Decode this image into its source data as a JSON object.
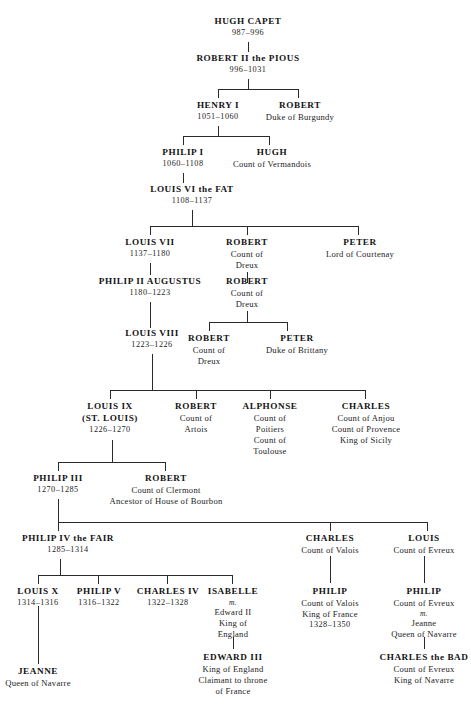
{
  "chart": {
    "kind": "genealogical-tree",
    "background_color": "#ffffff",
    "line_color": "#2a2a2a",
    "text_color": "#1a1a1a"
  },
  "people": {
    "hugh_capet": {
      "name": "HUGH CAPET",
      "dates": "987–996"
    },
    "robert_ii": {
      "name": "ROBERT II  the PIOUS",
      "dates": "996–1031"
    },
    "henry_i": {
      "name": "HENRY I",
      "dates": "1051–1060"
    },
    "robert_burgundy": {
      "name": "ROBERT",
      "t1": "Duke of Burgundy"
    },
    "philip_i": {
      "name": "PHILIP I",
      "dates": "1060–1108"
    },
    "hugh_vermandois": {
      "name": "HUGH",
      "t1": "Count of Vermandois"
    },
    "louis_vi": {
      "name": "LOUIS VI the FAT",
      "dates": "1108–1137"
    },
    "louis_vii": {
      "name": "LOUIS VII",
      "dates": "1137–1180"
    },
    "robert_dreux_1": {
      "name": "ROBERT",
      "t1": "Count of",
      "t2": "Dreux"
    },
    "peter_courtenay": {
      "name": "PETER",
      "t1": "Lord of Courtenay"
    },
    "philip_ii": {
      "name": "PHILIP II AUGUSTUS",
      "dates": "1180–1223"
    },
    "robert_dreux_2": {
      "name": "ROBERT",
      "t1": "Count of",
      "t2": "Dreux"
    },
    "louis_viii": {
      "name": "LOUIS VIII",
      "dates": "1223–1226"
    },
    "robert_dreux_3": {
      "name": "ROBERT",
      "t1": "Count of",
      "t2": "Dreux"
    },
    "peter_brittany": {
      "name": "PETER",
      "t1": "Duke of Brittany"
    },
    "louis_ix": {
      "name": "LOUIS IX",
      "name2": "(ST. LOUIS)",
      "dates": "1226–1270"
    },
    "robert_artois": {
      "name": "ROBERT",
      "t1": "Count of",
      "t2": "Artois"
    },
    "alphonse": {
      "name": "ALPHONSE",
      "t1": "Count of",
      "t2": "Poitiers",
      "t3": "Count of",
      "t4": "Toulouse"
    },
    "charles_anjou": {
      "name": "CHARLES",
      "t1": "Count of Anjou",
      "t2": "Count of Provence",
      "t3": "King of Sicily"
    },
    "philip_iii": {
      "name": "PHILIP III",
      "dates": "1270–1285"
    },
    "robert_clermont": {
      "name": "ROBERT",
      "t1": "Count of Clermont",
      "t2": "Ancestor of House of Bourbon"
    },
    "philip_iv": {
      "name": "PHILIP IV the FAIR",
      "dates": "1285–1314"
    },
    "charles_valois": {
      "name": "CHARLES",
      "t1": "Count of Valois"
    },
    "louis_evreux": {
      "name": "LOUIS",
      "t1": "Count of Evreux"
    },
    "louis_x": {
      "name": "LOUIS X",
      "dates": "1314–1316"
    },
    "philip_v": {
      "name": "PHILIP V",
      "dates": "1316–1322"
    },
    "charles_iv": {
      "name": "CHARLES IV",
      "dates": "1322–1328"
    },
    "isabelle": {
      "name": "ISABELLE",
      "marr": "m.",
      "t1": "Edward II",
      "t2": "King of",
      "t3": "England"
    },
    "philip_vi": {
      "name": "PHILIP",
      "t1": "Count of Valois",
      "t2": "King of France",
      "dates": "1328–1350"
    },
    "philip_evreux": {
      "name": "PHILIP",
      "t1": "Count of Evreux",
      "marr": "m.",
      "t2": "Jeanne",
      "t3": "Queen of Navarre"
    },
    "jeanne_navarre": {
      "name": "JEANNE",
      "t1": "Queen of Navarre"
    },
    "edward_iii": {
      "name": "EDWARD III",
      "t1": "King of England",
      "t2": "Claimant to throne",
      "t3": "of France"
    },
    "charles_bad": {
      "name": "CHARLES the BAD",
      "t1": "Count of Evreux",
      "t2": "King of Navarre"
    }
  }
}
